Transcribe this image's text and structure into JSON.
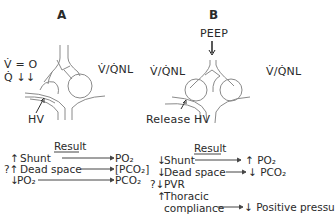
{
  "panel_a": {
    "letter": "A",
    "v_label": "V̇ = O",
    "q_label": "Q̇ ↓↓",
    "vq_label": "V̇/Q̇NL",
    "hv_label": "HV",
    "result_title": "Result",
    "rows": [
      {
        "prefix": "↑",
        "cause": "Shunt",
        "result": "PO₂"
      },
      {
        "prefix": "?↑",
        "cause": "Dead space",
        "result": "[PCO₂]"
      },
      {
        "prefix": "↓",
        "cause": "PO₂",
        "result": "PCO₂"
      }
    ]
  },
  "panel_b": {
    "letter": "B",
    "peep_label": "PEEP",
    "vq_left_label": "V̇/Q̇NL",
    "vq_right_label": "V̇/Q̇NL",
    "release_label": "Release HV",
    "result_title": "Result",
    "rows": [
      {
        "prefix": "↓",
        "cause": "Shunt",
        "result": "↑ PO₂"
      },
      {
        "prefix": "↓",
        "cause": "Dead space",
        "result": "↓ PCO₂"
      },
      {
        "prefix": "?↓",
        "cause": "PVR",
        "result": ""
      },
      {
        "prefix": "↑",
        "cause": "Thoracic",
        "cause_line2": "compliance",
        "result": "↓ Positive pressu"
      }
    ]
  },
  "colors": {
    "line": "#8a8a8a",
    "text": "#2a2a2a",
    "background": "#ffffff"
  }
}
